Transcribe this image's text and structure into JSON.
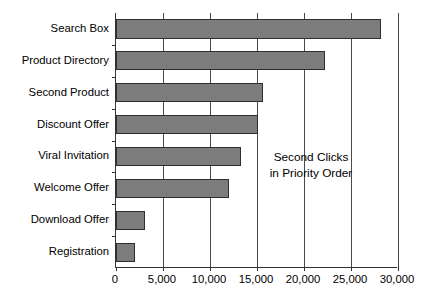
{
  "chart_data": {
    "type": "bar",
    "orientation": "horizontal",
    "title": "",
    "xlabel": "",
    "ylabel": "",
    "categories": [
      "Search Box",
      "Product Directory",
      "Second Product",
      "Discount Offer",
      "Viral Invitation",
      "Welcome Offer",
      "Download Offer",
      "Registration"
    ],
    "values": [
      28200,
      22200,
      15600,
      15100,
      13300,
      12000,
      3100,
      2000
    ],
    "xlim": [
      0,
      30000
    ],
    "xticks": [
      0,
      5000,
      10000,
      15000,
      20000,
      25000,
      30000
    ],
    "xtick_labels": [
      "0",
      "5,000",
      "10,000",
      "15,000",
      "20,000",
      "25,000",
      "30,000"
    ],
    "grid": "vertical",
    "legend": "none",
    "bar_color": "#7c7c7c",
    "bar_border_color": "#2e2e2e",
    "axis_color": "#333333",
    "annotations": [
      {
        "line1": "Second Clicks",
        "line2": "in Priority Order"
      }
    ]
  }
}
